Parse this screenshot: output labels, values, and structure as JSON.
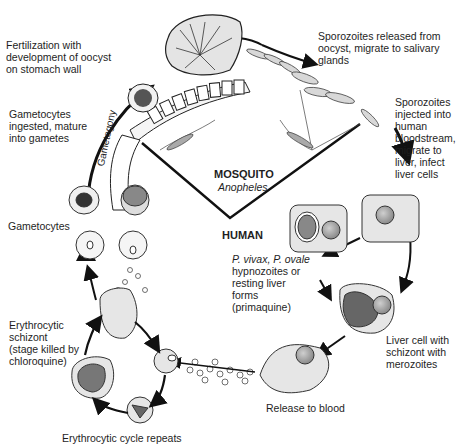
{
  "diagram": {
    "hosts": {
      "mosquito_label": "MOSQUITO",
      "mosquito_genus": "Anopheles",
      "human_label": "HUMAN"
    },
    "stage_band_label": "Gametogony",
    "labels": {
      "fertilization": [
        "Fertilization with",
        "development of oocyst",
        "on stomach wall"
      ],
      "gametocytes_ingested": [
        "Gametocytes",
        "ingested, mature",
        "into gametes"
      ],
      "sporozoites_released": [
        "Sporozoites released from",
        "oocyst, migrate to salivary",
        "glands"
      ],
      "sporozoites_injected": [
        "Sporozoites",
        "injected into",
        "human",
        "bloodstream,",
        "migrate to",
        "liver,  infect",
        "liver cells"
      ],
      "gametocytes": "Gametocytes",
      "hypnozoites_species": "P. vivax, P. ovale",
      "hypnozoites": [
        "hypnozoites or",
        "resting liver",
        "forms",
        "(primaquine)"
      ],
      "erythrocytic_schizont": [
        "Erythrocytic",
        "schizont",
        "(stage killed by",
        "chloroquine)"
      ],
      "liver_schizont": [
        "Liver cell with",
        "schizont with",
        "merozoites"
      ],
      "release_to_blood": "Release to blood",
      "erythrocytic_cycle": "Erythrocytic cycle repeats"
    },
    "colors": {
      "line": "#111111",
      "cell_fill": "#e8e8e8",
      "nucleus_fill": "#a8a8a8",
      "dark_fill": "#777777"
    }
  }
}
